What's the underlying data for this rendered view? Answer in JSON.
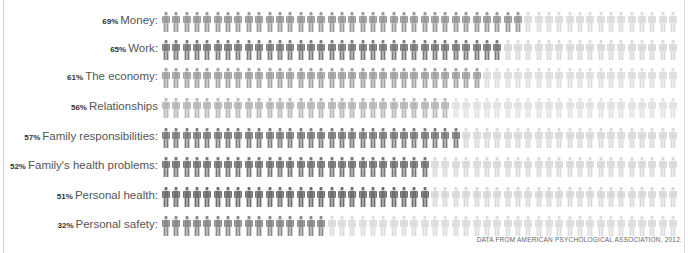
{
  "header": {
    "clipped_text": ""
  },
  "chart_data": {
    "type": "pictograph",
    "title": "",
    "unit": "Each figure = 2% of respondents (50 figures per row)",
    "categories": [
      "Money",
      "Work",
      "The economy",
      "Relationships",
      "Family responsibilities",
      "Family's health problems",
      "Personal health",
      "Personal safety"
    ],
    "values": [
      69,
      65,
      61,
      56,
      57,
      52,
      51,
      32
    ],
    "figures_total": 50,
    "figures_filled": [
      35,
      33,
      31,
      28,
      29,
      26,
      26,
      16
    ],
    "source": "DATA FROM AMERICAN PSYCHOLOGICAL ASSOCIATION, 2012."
  },
  "rows": [
    {
      "pct": "69%",
      "label": "Money:",
      "filled": 35,
      "color": "#9a9a9a",
      "empty": "#dcdcdc"
    },
    {
      "pct": "65%",
      "label": "Work:",
      "filled": 33,
      "color": "#7c7c7c",
      "empty": "#dadada"
    },
    {
      "pct": "61%",
      "label": "The economy:",
      "filled": 31,
      "color": "#a3a3a3",
      "empty": "#dedede"
    },
    {
      "pct": "56%",
      "label": "Relationships",
      "filled": 28,
      "color": "#b8b8b8",
      "empty": "#e2e2e2"
    },
    {
      "pct": "57%",
      "label": "Family responsibilities:",
      "filled": 29,
      "color": "#7e7e7e",
      "empty": "#dadada"
    },
    {
      "pct": "52%",
      "label": "Family's health problems:",
      "filled": 26,
      "color": "#777777",
      "empty": "#dadada"
    },
    {
      "pct": "51%",
      "label": "Personal health:",
      "filled": 26,
      "color": "#6f6f6f",
      "empty": "#d9d9d9"
    },
    {
      "pct": "32%",
      "label": "Personal safety:",
      "filled": 16,
      "color": "#8a8a8a",
      "empty": "#dcdcdc"
    }
  ],
  "footer": {
    "source": "DATA FROM AMERICAN PSYCHOLOGICAL ASSOCIATION, 2012."
  }
}
